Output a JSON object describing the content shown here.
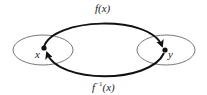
{
  "diagram": {
    "title": "",
    "sets": [
      {
        "id": "domain",
        "point_label": "x"
      },
      {
        "id": "codomain",
        "point_label": "y"
      }
    ],
    "arrows": [
      {
        "id": "forward",
        "label": "f(x)",
        "from": "x",
        "to": "y"
      },
      {
        "id": "inverse",
        "label_base": "f",
        "label_sup": "−1",
        "label_arg": "(x)",
        "from": "y",
        "to": "x"
      }
    ],
    "colors": {
      "ellipse": "#777777",
      "arrow": "#111111",
      "text": "#222222"
    }
  }
}
